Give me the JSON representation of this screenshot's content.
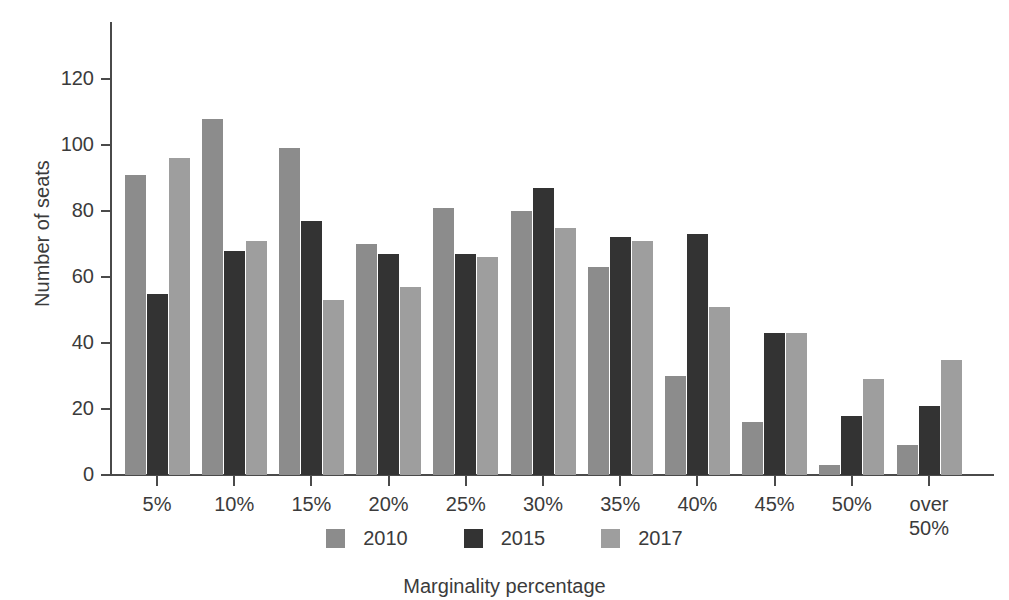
{
  "chart_data": {
    "type": "bar",
    "title": "",
    "xlabel": "Marginality percentage",
    "ylabel": "Number of seats",
    "categories": [
      "5%",
      "10%",
      "15%",
      "20%",
      "25%",
      "30%",
      "35%",
      "40%",
      "45%",
      "50%",
      "over\n50%"
    ],
    "series": [
      {
        "name": "2010",
        "color": "#8c8c8c",
        "values": [
          91,
          108,
          99,
          70,
          81,
          80,
          63,
          30,
          16,
          3,
          9
        ]
      },
      {
        "name": "2015",
        "color": "#333333",
        "values": [
          55,
          68,
          77,
          67,
          67,
          87,
          72,
          73,
          43,
          18,
          21
        ]
      },
      {
        "name": "2017",
        "color": "#9e9e9e",
        "values": [
          96,
          71,
          53,
          57,
          66,
          75,
          71,
          51,
          43,
          29,
          35
        ]
      }
    ],
    "ylim": [
      0,
      132
    ],
    "y_ticks": [
      0,
      20,
      40,
      60,
      80,
      100,
      120
    ],
    "y_tick_labels": [
      "0",
      "20",
      "40",
      "60",
      "80",
      "100",
      "120"
    ],
    "grid": false,
    "legend_position": "bottom"
  },
  "legend": {
    "items": [
      {
        "label": "2010",
        "color": "#8c8c8c"
      },
      {
        "label": "2015",
        "color": "#333333"
      },
      {
        "label": "2017",
        "color": "#9e9e9e"
      }
    ]
  },
  "axes": {
    "y_title": "Number of seats",
    "x_title": "Marginality percentage"
  }
}
